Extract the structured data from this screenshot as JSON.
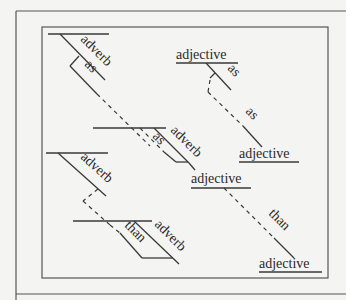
{
  "diagram": {
    "type": "sentence-diagram",
    "labels": {
      "top_left_adverb": "adverb",
      "top_left_as": "as",
      "top_right_adjective": "adjective",
      "top_right_as": "as",
      "dashed_as": "as",
      "mid_right_adjective": "adjective",
      "middle_as": "as",
      "middle_adverb": "adverb",
      "center_adjective": "adjective",
      "bottom_left_adverb": "adverb",
      "bottom_than": "than",
      "bottom_adverb": "adverb",
      "dashed_than": "than",
      "bottom_right_adjective": "adjective"
    },
    "colors": {
      "background": "#f4f4f2",
      "stroke": "#3a3a3a",
      "text": "#2a2a2a"
    }
  }
}
